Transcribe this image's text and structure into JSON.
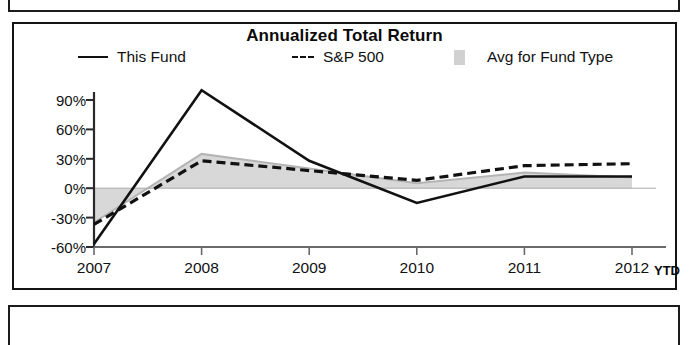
{
  "chart_data": {
    "type": "line",
    "title": "Annualized Total Return",
    "xlabel": "",
    "ylabel": "",
    "categories": [
      "2007",
      "2008",
      "2009",
      "2010",
      "2011",
      "2012"
    ],
    "x_axis_note": "YTD",
    "ylim": [
      -60,
      105
    ],
    "y_ticks": [
      90,
      60,
      30,
      0,
      -30,
      -60
    ],
    "y_tick_labels": [
      "90%",
      "60%",
      "30%",
      "0%",
      "-30%",
      "-60%"
    ],
    "grid": false,
    "legend_position": "top",
    "series": [
      {
        "name": "This Fund",
        "style": "solid",
        "color": "#111111",
        "values": [
          -57,
          100,
          28,
          -15,
          12,
          12
        ]
      },
      {
        "name": "S&P 500",
        "style": "dashed",
        "color": "#111111",
        "values": [
          -37,
          28,
          18,
          8,
          23,
          25
        ]
      },
      {
        "name": "Avg for Fund Type",
        "style": "area",
        "color": "#c9c9c9",
        "values": [
          -35,
          35,
          20,
          5,
          16,
          11
        ]
      }
    ]
  },
  "chart": {
    "title": "Annualized Total Return",
    "legend": [
      {
        "label": "This Fund",
        "marker": "solid-line-swatch"
      },
      {
        "label": "S&P 500",
        "marker": "dashed-line-swatch"
      },
      {
        "label": "Avg for Fund Type",
        "marker": "gray-area-swatch"
      }
    ],
    "y_axis": {
      "labels": [
        "90%",
        "60%",
        "30%",
        "0%",
        "-30%",
        "-60%"
      ]
    },
    "x_axis": {
      "labels": [
        "2007",
        "2008",
        "2009",
        "2010",
        "2011",
        "2012"
      ],
      "suffix": "YTD"
    }
  }
}
